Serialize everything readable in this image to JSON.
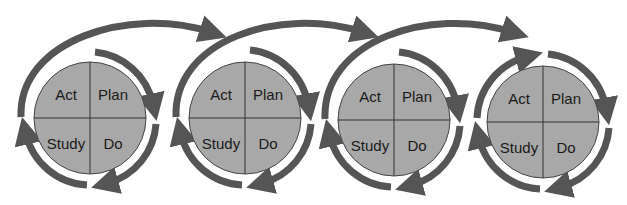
{
  "diagram": {
    "type": "repeating PDSA cycles",
    "colors": {
      "circle_fill": "#a8a8a8",
      "arrow": "#555555",
      "divider": "#333333",
      "text": "#1a1a1a"
    },
    "cycles": [
      {
        "quadrants": {
          "top_left": "Act",
          "top_right": "Plan",
          "bottom_left": "Study",
          "bottom_right": "Do"
        }
      },
      {
        "quadrants": {
          "top_left": "Act",
          "top_right": "Plan",
          "bottom_left": "Study",
          "bottom_right": "Do"
        }
      },
      {
        "quadrants": {
          "top_left": "Act",
          "top_right": "Plan",
          "bottom_left": "Study",
          "bottom_right": "Do"
        }
      },
      {
        "quadrants": {
          "top_left": "Act",
          "top_right": "Plan",
          "bottom_left": "Study",
          "bottom_right": "Do"
        }
      }
    ]
  }
}
